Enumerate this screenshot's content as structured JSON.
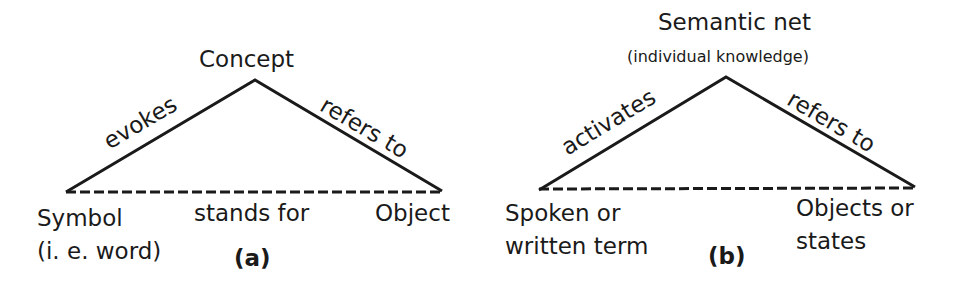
{
  "diagram_a": {
    "apex_label": "Concept",
    "left_edge_label": "evokes",
    "right_edge_label": "refers to",
    "base_label": "stands for",
    "left_node_line1": "Symbol",
    "left_node_line2": "(i. e. word)",
    "right_node": "Object",
    "caption": "(a)"
  },
  "diagram_b": {
    "apex_label": "Semantic net",
    "apex_sublabel": "(individual knowledge)",
    "left_edge_label": "activates",
    "right_edge_label": "refers to",
    "left_node_line1": "Spoken or",
    "left_node_line2": "written term",
    "right_node_line1": "Objects or",
    "right_node_line2": "states",
    "caption": "(b)"
  },
  "colors": {
    "line": "#1a1a1a",
    "background": "#ffffff"
  }
}
